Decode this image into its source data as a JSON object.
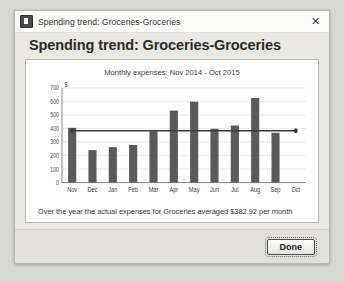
{
  "window": {
    "titlebar_text": "Spending trend: Groceries-Groceries",
    "close_label": "✕",
    "heading": "Spending trend: Groceries-Groceries",
    "summary": "Over the year the actual expenses for Groceries averaged $382.92 per month",
    "done_label": "Done"
  },
  "colors": {
    "bar": "#5a5a5a",
    "average_line": "#3a3a3a",
    "grid": "#dcdcdc",
    "axis": "#6b6b6b",
    "panel_background": "#ffffff",
    "dialog_background": "#e9e8e5"
  },
  "chart_data": {
    "type": "bar",
    "title": "Monthly expenses: Nov 2014 - Oct 2015",
    "xlabel": "",
    "ylabel": "$",
    "categories": [
      "Nov",
      "Dec",
      "Jan",
      "Feb",
      "Mar",
      "Apr",
      "May",
      "Jun",
      "Jul",
      "Aug",
      "Sep",
      "Oct"
    ],
    "values": [
      405,
      240,
      262,
      278,
      380,
      532,
      598,
      398,
      422,
      625,
      368,
      0
    ],
    "ylim": [
      0,
      700
    ],
    "yticks": [
      0,
      100,
      200,
      300,
      400,
      500,
      600,
      700
    ],
    "ytick_labels": [
      "0",
      "100",
      "200",
      "300",
      "400",
      "500",
      "600",
      "700"
    ],
    "grid": true,
    "legend": "none",
    "annotations": [
      {
        "type": "average_line",
        "label": "average",
        "value": 382.92,
        "style": "horizontal line with round end markers"
      }
    ]
  }
}
